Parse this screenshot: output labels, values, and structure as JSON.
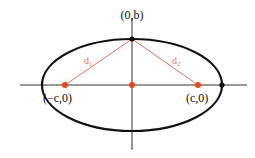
{
  "diagram": {
    "type": "ellipse-foci",
    "colors": {
      "curve": "#111111",
      "axes": "#333333",
      "focus": "#e8461e",
      "distance": "#e8735a"
    },
    "labels": {
      "top_vertex": "(0,b)",
      "left_focus": "(−c,0)",
      "right_focus": "(c,0)",
      "d1": "d",
      "d1_sub": "1",
      "d2": "d",
      "d2_sub": "2"
    },
    "points": [
      {
        "name": "top-vertex",
        "label": "(0,b)"
      },
      {
        "name": "left-focus",
        "label": "(−c,0)"
      },
      {
        "name": "center",
        "label": ""
      },
      {
        "name": "right-focus",
        "label": "(c,0)"
      },
      {
        "name": "right-vertex",
        "label": ""
      }
    ]
  }
}
